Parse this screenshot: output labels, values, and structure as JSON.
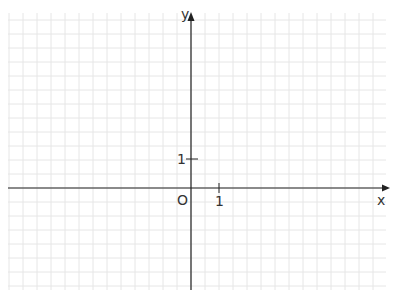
{
  "diagram": {
    "type": "coordinate-plane",
    "axes": {
      "x_label": "x",
      "y_label": "y",
      "origin_label": "O",
      "x_tick_label": "1",
      "y_tick_label": "1"
    },
    "grid": {
      "cell_px": 14,
      "cells_per_unit": 2,
      "line_color": "#e6e6e6",
      "axis_color": "#222222"
    }
  }
}
